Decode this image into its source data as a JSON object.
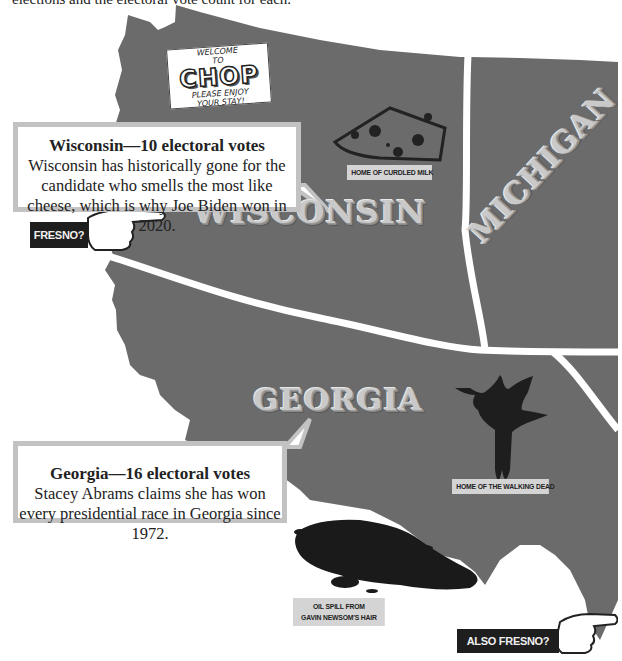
{
  "intro_text": "elections and the electoral vote count for each.",
  "colors": {
    "map_fill": "#6b6b6b",
    "border": "#ffffff",
    "label": "#c9c9c9",
    "callout_border": "#c2c2c2",
    "tag_bg": "#d4d4d4",
    "dark_tag_bg": "#1e1e1e"
  },
  "sign": {
    "line1": "WELCOME",
    "line2": "TO",
    "name": "CHOP",
    "line3": "PLEASE ENJOY",
    "line4": "YOUR STAY!"
  },
  "states": {
    "wisconsin": "WISCONSIN",
    "michigan": "MICHIGAN",
    "georgia": "GEORGIA"
  },
  "callouts": [
    {
      "title": "Wisconsin—10 electoral votes",
      "body": "Wisconsin has historically gone for the candidate who smells the most like cheese, which is why Joe Biden won in 2020."
    },
    {
      "title": "Georgia—16 electoral votes",
      "body": "Stacey Abrams claims she has won every presidential race in Georgia since 1972."
    }
  ],
  "tags": {
    "cheese": "HOME OF CURDLED MILK",
    "walking_dead": "HOME OF THE WALKING DEAD",
    "oil_spill_line1": "OIL SPILL FROM",
    "oil_spill_line2": "GAVIN NEWSOM'S HAIR"
  },
  "pointers": {
    "fresno": "FRESNO?",
    "also_fresno": "ALSO FRESNO?"
  }
}
